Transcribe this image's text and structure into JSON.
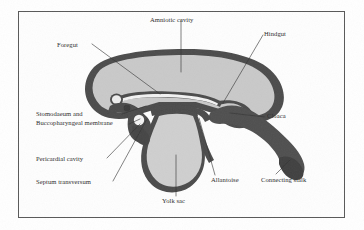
{
  "figure": {
    "frame": {
      "border_color": "#585858",
      "background": "#fefefe"
    },
    "palette": {
      "amniotic_fill": "#c9c9c9",
      "yolk_sac_fill": "#cfcfcf",
      "membrane_dark": "#4b4b4b",
      "connecting_stalk": "#4f4f4f",
      "lumen_light": "#f2f2f2",
      "leader_line": "#333333",
      "label_text": "#2b2b2b"
    },
    "labels": [
      {
        "id": "amniotic-cavity",
        "text": "Amniotic cavity",
        "x": 150,
        "y": 16,
        "align": "left"
      },
      {
        "id": "hindgut",
        "text": "Hindgut",
        "x": 264,
        "y": 30,
        "align": "left"
      },
      {
        "id": "foregut",
        "text": "Foregut",
        "x": 57,
        "y": 41,
        "align": "left"
      },
      {
        "id": "cloaca",
        "text": "Cloaca",
        "x": 267,
        "y": 115,
        "align": "left"
      },
      {
        "id": "stomodaeum",
        "text": "Stomodaeum and",
        "x": 36,
        "y": 113,
        "align": "left"
      },
      {
        "id": "buccopharyngeal",
        "text": "Buccopharyngeal membrane",
        "x": 36,
        "y": 122,
        "align": "left"
      },
      {
        "id": "pericardial-cavity",
        "text": "Pericardial cavity",
        "x": 36,
        "y": 161,
        "align": "left"
      },
      {
        "id": "septum-transversum",
        "text": "Septum transversum",
        "x": 36,
        "y": 183,
        "align": "left"
      },
      {
        "id": "allantoise",
        "text": "Allantoise",
        "x": 211,
        "y": 178,
        "align": "left"
      },
      {
        "id": "connecting-stalk",
        "text": "Connecting stalk",
        "x": 261,
        "y": 178,
        "align": "left"
      },
      {
        "id": "yolk-sac",
        "text": "Yolk sac",
        "x": 162,
        "y": 199,
        "align": "left"
      }
    ],
    "structures": [
      {
        "id": "amniotic-cavity-region",
        "name": "Amniotic cavity"
      },
      {
        "id": "yolk-sac-region",
        "name": "Yolk sac"
      },
      {
        "id": "connecting-stalk-band",
        "name": "Connecting stalk"
      },
      {
        "id": "foregut-tube",
        "name": "Foregut"
      },
      {
        "id": "hindgut-tube",
        "name": "Hindgut"
      },
      {
        "id": "cloaca-region",
        "name": "Cloaca"
      },
      {
        "id": "allantois-duct",
        "name": "Allantois"
      },
      {
        "id": "pericardial-cavity-region",
        "name": "Pericardial cavity"
      },
      {
        "id": "buccopharyngeal-membrane",
        "name": "Buccopharyngeal membrane"
      },
      {
        "id": "septum-transversum-region",
        "name": "Septum transversum"
      }
    ]
  }
}
